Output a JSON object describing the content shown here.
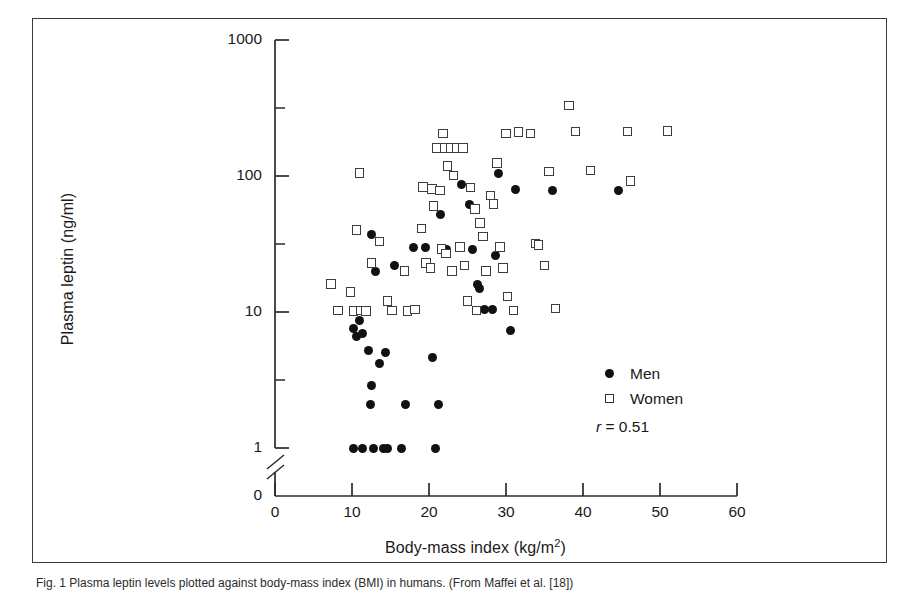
{
  "figure": {
    "caption": "Fig. 1 Plasma leptin levels plotted against body-mass index (BMI) in humans. (From Maffei et al. [18])",
    "caption_prefix": "Fig. 1"
  },
  "legend": {
    "position": "inside-bottom-right",
    "entries": [
      {
        "label": "Men",
        "symbol": "filled-circle",
        "color": "#111111"
      },
      {
        "label": "Women",
        "symbol": "open-square",
        "color": "#3d3d3d"
      }
    ],
    "correlation_symbol": "r",
    "correlation_text": " = 0.51",
    "correlation_value": 0.51
  },
  "axes": {
    "x": {
      "label": "Body-mass index (kg/m",
      "label_sup": "2",
      "label_tail": ")",
      "ticks": [
        "0",
        "10",
        "20",
        "30",
        "40",
        "50",
        "60"
      ],
      "min": 0,
      "max": 60,
      "scale": "linear"
    },
    "y": {
      "label": "Plasma leptin (ng/ml)",
      "ticks": [
        "1000",
        "100",
        "10",
        "1",
        "0"
      ],
      "min": 1,
      "max": 1000,
      "scale": "log",
      "axis_break": true,
      "break_note": "broken axis between 0 and 1"
    }
  },
  "chart_data": {
    "type": "scatter",
    "title": "",
    "xlabel": "Body-mass index (kg/m2)",
    "ylabel": "Plasma leptin (ng/ml)",
    "xlim": [
      0,
      60
    ],
    "ylim": [
      1,
      1000
    ],
    "yscale": "log",
    "xscale": "linear",
    "grid": false,
    "legend_position": "lower right",
    "annotations": [
      "r = 0.51"
    ],
    "series": [
      {
        "name": "Men",
        "marker": "filled-circle",
        "color": "#111111",
        "points": [
          [
            10.2,
            7.6
          ],
          [
            10.6,
            6.6
          ],
          [
            11.0,
            8.6
          ],
          [
            11.4,
            7.0
          ],
          [
            12.2,
            5.2
          ],
          [
            12.4,
            2.1
          ],
          [
            12.5,
            2.9
          ],
          [
            13.0,
            20.0
          ],
          [
            13.6,
            4.2
          ],
          [
            14.3,
            5.0
          ],
          [
            10.2,
            1.0
          ],
          [
            11.4,
            1.0
          ],
          [
            12.8,
            1.0
          ],
          [
            14.1,
            1.0
          ],
          [
            14.6,
            1.0
          ],
          [
            17.0,
            2.1
          ],
          [
            16.4,
            1.0
          ],
          [
            20.8,
            1.0
          ],
          [
            12.5,
            37.0
          ],
          [
            15.5,
            22.0
          ],
          [
            18.0,
            30.0
          ],
          [
            20.5,
            4.6
          ],
          [
            21.2,
            2.1
          ],
          [
            19.6,
            30.0
          ],
          [
            21.5,
            52.0
          ],
          [
            22.3,
            29.0
          ],
          [
            24.2,
            86.0
          ],
          [
            25.2,
            62.0
          ],
          [
            25.6,
            29.0
          ],
          [
            26.3,
            16.0
          ],
          [
            26.6,
            15.0
          ],
          [
            27.2,
            10.4
          ],
          [
            28.3,
            10.5
          ],
          [
            28.6,
            26.0
          ],
          [
            29.0,
            105.0
          ],
          [
            30.6,
            7.3
          ],
          [
            31.2,
            80.0
          ],
          [
            36.0,
            78.0
          ],
          [
            44.6,
            78.0
          ]
        ]
      },
      {
        "name": "Women",
        "marker": "open-square",
        "color": "#3d3d3d",
        "points": [
          [
            7.3,
            16.0
          ],
          [
            8.2,
            10.3
          ],
          [
            9.8,
            14.0
          ],
          [
            10.2,
            10.2
          ],
          [
            11.2,
            10.3
          ],
          [
            11.8,
            10.2
          ],
          [
            10.6,
            40.0
          ],
          [
            11.0,
            105.0
          ],
          [
            12.5,
            23.0
          ],
          [
            13.6,
            33.0
          ],
          [
            14.6,
            12.0
          ],
          [
            15.2,
            10.3
          ],
          [
            16.8,
            20.0
          ],
          [
            17.2,
            10.2
          ],
          [
            18.2,
            10.4
          ],
          [
            19.0,
            41.0
          ],
          [
            19.6,
            23.0
          ],
          [
            20.2,
            21.0
          ],
          [
            19.2,
            83.0
          ],
          [
            20.4,
            80.0
          ],
          [
            21.4,
            78.0
          ],
          [
            20.6,
            60.0
          ],
          [
            21.6,
            29.0
          ],
          [
            22.2,
            27.0
          ],
          [
            21.0,
            160.0
          ],
          [
            22.0,
            160.0
          ],
          [
            22.8,
            160.0
          ],
          [
            23.6,
            160.0
          ],
          [
            24.4,
            160.0
          ],
          [
            21.8,
            205.0
          ],
          [
            22.4,
            118.0
          ],
          [
            23.2,
            101.0
          ],
          [
            23.0,
            20.0
          ],
          [
            24.0,
            30.0
          ],
          [
            24.6,
            22.0
          ],
          [
            25.4,
            82.0
          ],
          [
            26.0,
            57.0
          ],
          [
            26.6,
            45.0
          ],
          [
            27.0,
            36.0
          ],
          [
            25.0,
            12.0
          ],
          [
            26.2,
            10.3
          ],
          [
            27.4,
            20.0
          ],
          [
            28.0,
            72.0
          ],
          [
            28.4,
            62.0
          ],
          [
            29.2,
            30.0
          ],
          [
            29.6,
            21.0
          ],
          [
            30.2,
            13.0
          ],
          [
            31.0,
            10.3
          ],
          [
            28.8,
            125.0
          ],
          [
            30.0,
            205.0
          ],
          [
            31.6,
            210.0
          ],
          [
            33.2,
            205.0
          ],
          [
            33.8,
            32.0
          ],
          [
            34.2,
            31.0
          ],
          [
            35.0,
            22.0
          ],
          [
            35.6,
            108.0
          ],
          [
            36.4,
            10.6
          ],
          [
            38.2,
            330.0
          ],
          [
            39.0,
            212.0
          ],
          [
            41.0,
            110.0
          ],
          [
            45.8,
            212.0
          ],
          [
            46.2,
            92.0
          ],
          [
            51.0,
            215.0
          ]
        ]
      }
    ]
  }
}
